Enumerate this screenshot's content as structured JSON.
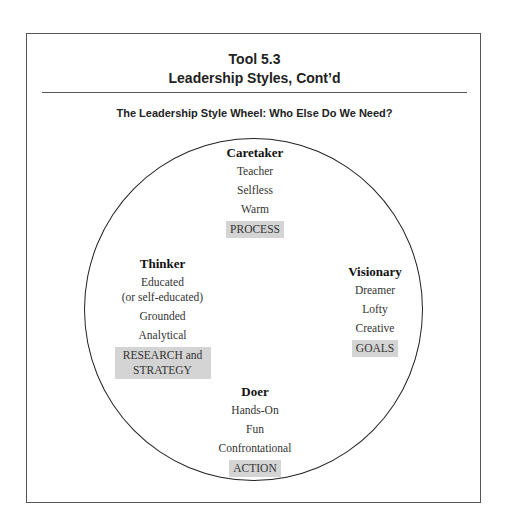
{
  "header": {
    "tool_number": "Tool 5.3",
    "title": "Leadership Styles, Cont’d"
  },
  "subtitle": "The Leadership Style Wheel: Who Else Do We Need?",
  "wheel": {
    "caretaker": {
      "name": "Caretaker",
      "traits": [
        "Teacher",
        "Selfless",
        "Warm"
      ],
      "focus": "PROCESS"
    },
    "thinker": {
      "name": "Thinker",
      "traits": [
        "Educated",
        "(or self-educated)",
        "Grounded",
        "Analytical"
      ],
      "focus": "RESEARCH and STRATEGY"
    },
    "visionary": {
      "name": "Visionary",
      "traits": [
        "Dreamer",
        "Lofty",
        "Creative"
      ],
      "focus": "GOALS"
    },
    "doer": {
      "name": "Doer",
      "traits": [
        "Hands-On",
        "Fun",
        "Confrontational"
      ],
      "focus": "ACTION"
    }
  },
  "colors": {
    "focus_highlight": "#d4d4d4",
    "border": "#555555"
  }
}
